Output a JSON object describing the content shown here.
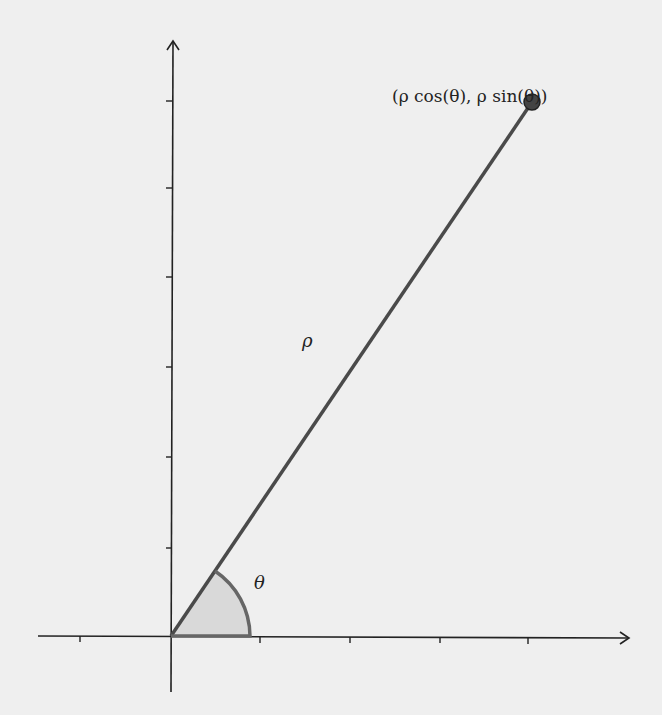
{
  "diagram": {
    "point_label": "(ρ cos(θ), ρ sin(θ))",
    "radius_label": "ρ",
    "angle_label": "θ",
    "colors": {
      "axis": "#222222",
      "ray": "#4a4a4a",
      "point": "#444444",
      "arc": "#666666",
      "sector_fill": "#d9d9d9",
      "background": "#efefef"
    },
    "origin": [
      171,
      636
    ],
    "point": [
      532,
      102
    ],
    "x_ticks": [
      80,
      260,
      350,
      440,
      528
    ],
    "y_ticks": [
      101,
      188,
      277,
      367,
      457,
      548
    ]
  }
}
